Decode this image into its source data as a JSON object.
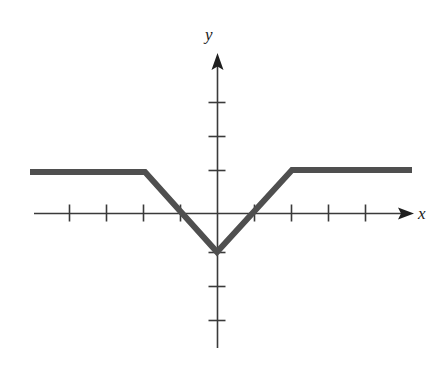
{
  "figure": {
    "title": "",
    "caption": ""
  },
  "axes": {
    "x_label": "x",
    "y_label": "y",
    "axis_color": "#3a3a3a",
    "origin_px": {
      "x": 217,
      "y": 213
    },
    "unit_px": 37,
    "x_tick_positions_px": [
      69,
      106,
      143,
      180,
      254,
      291,
      328,
      365
    ],
    "y_tick_positions_px": [
      102,
      136,
      170,
      252,
      286,
      320
    ],
    "x_tick_values": [
      -4,
      -3,
      -2,
      -1,
      1,
      2,
      3,
      4
    ],
    "y_tick_values": [
      3,
      2,
      1,
      -1,
      -2,
      -3
    ],
    "x_axis_arrow": true,
    "y_axis_arrow": true,
    "tick_labels_shown": false,
    "grid": false
  },
  "chart_data": {
    "type": "line",
    "title": "",
    "xlabel": "x",
    "ylabel": "y",
    "xlim": [
      -5,
      5.3
    ],
    "ylim": [
      -4.3,
      4.4
    ],
    "grid": false,
    "legend": "none",
    "series": [
      {
        "name": "f",
        "expression": "max(-1, min(1, |x| - 1))",
        "color": "#4f4f4f",
        "linewidth_px": 6,
        "x": [
          -5.05,
          -2,
          0,
          2,
          5.27
        ],
        "y": [
          1,
          1,
          -1,
          1,
          1
        ],
        "points_px": [
          {
            "x": 30,
            "y": 172
          },
          {
            "x": 145,
            "y": 172
          },
          {
            "x": 217,
            "y": 252
          },
          {
            "x": 292,
            "y": 170
          },
          {
            "x": 412,
            "y": 170
          }
        ]
      }
    ],
    "annotations": []
  }
}
